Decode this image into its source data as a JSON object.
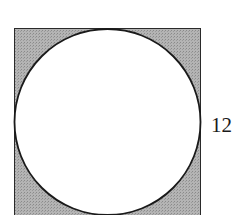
{
  "diagram": {
    "type": "circle inscribed in square",
    "side_label": "12",
    "colors": {
      "shaded_region": "#a9a9a9",
      "outline": "#1a1a1a",
      "circle_fill": "#ffffff"
    }
  }
}
